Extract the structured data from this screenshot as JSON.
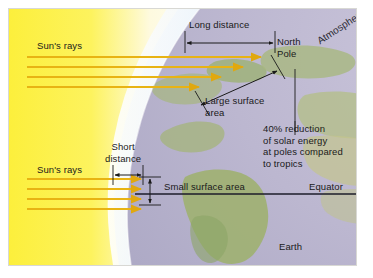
{
  "figure": {
    "background_color": "#ffffff",
    "frame_color": "#d8d8d4"
  },
  "colors": {
    "sun_glow_core": "#fdf24a",
    "sun_glow_edge": "#fdfbe0",
    "ray": "#e8b313",
    "atmosphere": "#e8f0fa",
    "ocean": "#b9b4cf",
    "land": "#a9b97e",
    "annotation_line": "#1a1a1a",
    "equator_line": "#1c1c2a"
  },
  "labels": {
    "suns_rays_top": "Sun's rays",
    "suns_rays_bottom": "Sun's rays",
    "long_distance": "Long distance",
    "short_distance": "Short\ndistance",
    "north_pole": "North\nPole",
    "atmosphere": "Atmosphere",
    "large_surface_area": "Large surface\narea",
    "small_surface_area": "Small surface area",
    "reduction_note": "40% reduction\nof solar energy\nat poles compared\nto tropics",
    "equator": "Equator",
    "earth": "Earth"
  },
  "annotations": {
    "reduction_percent": "40%",
    "long_distance_arrow": "double-headed-horizontal-arrow",
    "short_distance_arrow": "double-headed-horizontal-arrow",
    "small_surface_arrow": "double-headed-vertical-arrow",
    "large_surface_arrow": "double-headed-diagonal-arrow"
  },
  "rays": {
    "top_group_count": 4,
    "bottom_group_count": 4
  }
}
